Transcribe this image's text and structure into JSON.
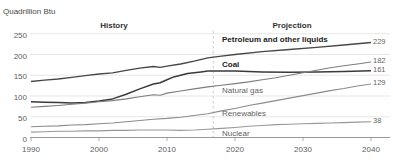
{
  "unit_label": "Quadrillion Btu",
  "sections": {
    "history": "History",
    "projection": "Projection"
  },
  "chart_data": {
    "type": "line",
    "title": "",
    "ylabel": "Quadrillion Btu",
    "xlabel": "",
    "grid": "horizontal",
    "legend_position": "inline-labels",
    "x_axis": {
      "min": 1990,
      "max": 2040,
      "ticks": [
        1990,
        2000,
        2010,
        2020,
        2030,
        2040
      ]
    },
    "y_axis": {
      "min": 0,
      "max": 250,
      "ticks": [
        0,
        50,
        100,
        150,
        200,
        250
      ]
    },
    "history_projection_divider_year": 2016.8,
    "series": [
      {
        "id": "petroleum-and-other-liquids",
        "name": "Petroleum and other liquids",
        "end_label": "229",
        "label_style": "dark",
        "color": "#474747",
        "width": 1.3,
        "points": [
          [
            1990,
            135
          ],
          [
            1992,
            138
          ],
          [
            1994,
            141
          ],
          [
            1996,
            145
          ],
          [
            1998,
            149
          ],
          [
            2000,
            153
          ],
          [
            2002,
            156
          ],
          [
            2004,
            162
          ],
          [
            2006,
            167
          ],
          [
            2008,
            171
          ],
          [
            2009,
            169
          ],
          [
            2010,
            172
          ],
          [
            2012,
            177
          ],
          [
            2014,
            184
          ],
          [
            2016,
            192
          ],
          [
            2018,
            196
          ],
          [
            2020,
            200
          ],
          [
            2024,
            207
          ],
          [
            2028,
            212
          ],
          [
            2032,
            217
          ],
          [
            2036,
            223
          ],
          [
            2040,
            229
          ]
        ]
      },
      {
        "id": "coal",
        "name": "Coal",
        "end_label": "161",
        "label_style": "dark",
        "color": "#3a3a3a",
        "width": 1.5,
        "points": [
          [
            1990,
            86
          ],
          [
            1992,
            85
          ],
          [
            1994,
            84
          ],
          [
            1996,
            83
          ],
          [
            1998,
            84
          ],
          [
            2000,
            88
          ],
          [
            2002,
            93
          ],
          [
            2004,
            104
          ],
          [
            2006,
            117
          ],
          [
            2008,
            129
          ],
          [
            2009,
            132
          ],
          [
            2010,
            139
          ],
          [
            2011,
            146
          ],
          [
            2012,
            150
          ],
          [
            2013,
            154
          ],
          [
            2014,
            156
          ],
          [
            2015,
            158
          ],
          [
            2016,
            160
          ],
          [
            2018,
            160
          ],
          [
            2020,
            160
          ],
          [
            2024,
            158
          ],
          [
            2028,
            157
          ],
          [
            2032,
            158
          ],
          [
            2036,
            159
          ],
          [
            2040,
            161
          ]
        ]
      },
      {
        "id": "natural-gas",
        "name": "Natural gas",
        "end_label": "182",
        "label_style": "gray",
        "color": "#7d7d7d",
        "width": 1.1,
        "points": [
          [
            1990,
            73
          ],
          [
            1992,
            75
          ],
          [
            1994,
            77
          ],
          [
            1996,
            80
          ],
          [
            1998,
            83
          ],
          [
            2000,
            86
          ],
          [
            2002,
            89
          ],
          [
            2004,
            93
          ],
          [
            2006,
            98
          ],
          [
            2008,
            103
          ],
          [
            2009,
            102
          ],
          [
            2010,
            107
          ],
          [
            2012,
            112
          ],
          [
            2014,
            117
          ],
          [
            2016,
            122
          ],
          [
            2018,
            126
          ],
          [
            2020,
            130
          ],
          [
            2022,
            134
          ],
          [
            2024,
            139
          ],
          [
            2026,
            144
          ],
          [
            2028,
            150
          ],
          [
            2030,
            156
          ],
          [
            2032,
            162
          ],
          [
            2034,
            168
          ],
          [
            2036,
            173
          ],
          [
            2038,
            177
          ],
          [
            2040,
            182
          ]
        ]
      },
      {
        "id": "renewables",
        "name": "Renewables",
        "end_label": "129",
        "label_style": "gray",
        "color": "#8c8c8c",
        "width": 1.1,
        "points": [
          [
            1990,
            26
          ],
          [
            1992,
            27
          ],
          [
            1994,
            28
          ],
          [
            1996,
            30
          ],
          [
            1998,
            31
          ],
          [
            2000,
            33
          ],
          [
            2002,
            35
          ],
          [
            2004,
            38
          ],
          [
            2006,
            41
          ],
          [
            2008,
            44
          ],
          [
            2010,
            46
          ],
          [
            2012,
            49
          ],
          [
            2014,
            53
          ],
          [
            2016,
            57
          ],
          [
            2018,
            64
          ],
          [
            2020,
            70
          ],
          [
            2022,
            77
          ],
          [
            2024,
            83
          ],
          [
            2026,
            89
          ],
          [
            2028,
            95
          ],
          [
            2030,
            101
          ],
          [
            2032,
            107
          ],
          [
            2034,
            113
          ],
          [
            2036,
            118
          ],
          [
            2038,
            124
          ],
          [
            2040,
            129
          ]
        ]
      },
      {
        "id": "nuclear",
        "name": "Nuclear",
        "end_label": "38",
        "label_style": "gray",
        "color": "#989898",
        "width": 1.1,
        "points": [
          [
            1990,
            13
          ],
          [
            1992,
            14
          ],
          [
            1994,
            15
          ],
          [
            1996,
            15
          ],
          [
            1998,
            16
          ],
          [
            2000,
            16
          ],
          [
            2002,
            17
          ],
          [
            2004,
            17
          ],
          [
            2006,
            18
          ],
          [
            2008,
            18
          ],
          [
            2010,
            18
          ],
          [
            2012,
            17
          ],
          [
            2014,
            18
          ],
          [
            2016,
            20
          ],
          [
            2018,
            22
          ],
          [
            2020,
            24
          ],
          [
            2022,
            27
          ],
          [
            2024,
            29
          ],
          [
            2026,
            31
          ],
          [
            2028,
            32
          ],
          [
            2030,
            33
          ],
          [
            2032,
            34
          ],
          [
            2034,
            35
          ],
          [
            2036,
            36
          ],
          [
            2038,
            37
          ],
          [
            2040,
            38
          ]
        ]
      }
    ]
  }
}
